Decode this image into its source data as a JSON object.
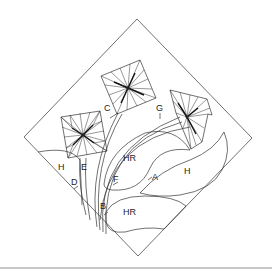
{
  "diagram": {
    "colors": {
      "stroke": "#333333",
      "background": "#ffffff",
      "footer_rule": "#c8c8c8"
    },
    "labels": [
      {
        "id": "C",
        "text": "C",
        "x": 104,
        "y": 111
      },
      {
        "id": "G",
        "text": "G",
        "x": 156,
        "y": 111
      },
      {
        "id": "H-left",
        "text": "H",
        "x": 58,
        "y": 170
      },
      {
        "id": "E",
        "text": "E",
        "x": 81,
        "y": 170
      },
      {
        "id": "D",
        "text": "D",
        "x": 71,
        "y": 185
      },
      {
        "id": "F",
        "text": "F",
        "x": 113,
        "y": 182
      },
      {
        "id": "HR-top",
        "text": "HR",
        "x": 123,
        "y": 161
      },
      {
        "id": "A",
        "text": "A",
        "x": 152,
        "y": 180
      },
      {
        "id": "H-right",
        "text": "H",
        "x": 184,
        "y": 174
      },
      {
        "id": "B",
        "text": "B",
        "x": 100,
        "y": 209
      },
      {
        "id": "HR-bottom",
        "text": "HR",
        "x": 123,
        "y": 215
      }
    ]
  }
}
